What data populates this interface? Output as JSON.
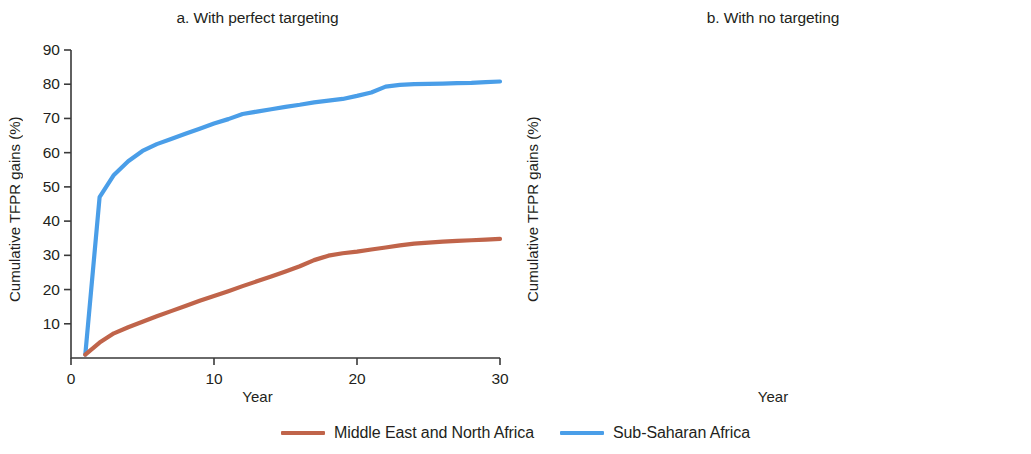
{
  "legend": {
    "items": [
      {
        "label": "Middle East and North Africa",
        "color": "#c0644a",
        "key": "mena"
      },
      {
        "label": "Sub-Saharan Africa",
        "color": "#4a9ee8",
        "key": "ssa"
      }
    ]
  },
  "panels": {
    "a": {
      "title": "a. With perfect targeting",
      "xlabel": "Year",
      "ylabel": "Cumulative TFPR gains (%)",
      "yticks": [
        "90",
        "80",
        "70",
        "60",
        "50",
        "40",
        "30",
        "20",
        "10"
      ],
      "xticks": [
        "0",
        "10",
        "20",
        "30"
      ]
    },
    "b": {
      "title": "b. With no targeting",
      "xlabel": "Year",
      "ylabel": "Cumulative TFPR gains (%)",
      "yticks": [
        "0",
        "-10",
        "-20",
        "-30",
        "-40",
        "-50",
        "-60"
      ],
      "xticks": [
        "0",
        "10",
        "20",
        "30"
      ]
    }
  },
  "chart_data": [
    {
      "id": "panel-a",
      "type": "line",
      "title": "a. With perfect targeting",
      "xlabel": "Year",
      "ylabel": "Cumulative TFPR gains (%)",
      "xlim": [
        0,
        30
      ],
      "ylim": [
        0,
        90
      ],
      "xticks": [
        0,
        10,
        20,
        30
      ],
      "yticks": [
        10,
        20,
        30,
        40,
        50,
        60,
        70,
        80,
        90
      ],
      "grid": false,
      "legend_position": "bottom-shared",
      "x": [
        1,
        2,
        3,
        4,
        5,
        6,
        7,
        8,
        9,
        10,
        11,
        12,
        13,
        14,
        15,
        16,
        17,
        18,
        19,
        20,
        21,
        22,
        23,
        24,
        25,
        26,
        27,
        28,
        29,
        30
      ],
      "series": [
        {
          "name": "Sub-Saharan Africa",
          "color": "#4a9ee8",
          "values": [
            1.0,
            47.0,
            53.5,
            57.5,
            60.5,
            62.5,
            64.0,
            65.5,
            67.0,
            68.5,
            69.8,
            71.3,
            72.0,
            72.7,
            73.4,
            74.0,
            74.7,
            75.2,
            75.7,
            76.6,
            77.6,
            79.3,
            79.8,
            80.0,
            80.1,
            80.2,
            80.3,
            80.4,
            80.6,
            80.8
          ]
        },
        {
          "name": "Middle East and North Africa",
          "color": "#c0644a",
          "values": [
            1.0,
            4.5,
            7.2,
            9.0,
            10.6,
            12.2,
            13.7,
            15.2,
            16.7,
            18.1,
            19.5,
            21.0,
            22.4,
            23.8,
            25.3,
            26.8,
            28.6,
            29.9,
            30.6,
            31.1,
            31.7,
            32.3,
            32.9,
            33.4,
            33.7,
            34.0,
            34.2,
            34.4,
            34.6,
            34.8
          ]
        }
      ]
    },
    {
      "id": "panel-b",
      "type": "line",
      "title": "b. With no targeting",
      "xlabel": "Year",
      "ylabel": "Cumulative TFPR gains (%)",
      "xlim": [
        0,
        30
      ],
      "ylim": [
        -60,
        0
      ],
      "xticks": [
        0,
        10,
        20,
        30
      ],
      "yticks": [
        -60,
        -50,
        -40,
        -30,
        -20,
        -10,
        0
      ],
      "grid": false,
      "reference_line": {
        "y": 0,
        "style": "dashed",
        "color": "#231f20"
      },
      "legend_position": "bottom-shared",
      "x": [
        0,
        1,
        2,
        3,
        4,
        5,
        6,
        7,
        8,
        9,
        10,
        11,
        12,
        13,
        14,
        15,
        16,
        17,
        18,
        19,
        20,
        21,
        22,
        23,
        24,
        25,
        26,
        27,
        28,
        29,
        30
      ],
      "series": [
        {
          "name": "Sub-Saharan Africa",
          "color": "#4a9ee8",
          "values": [
            -0.3,
            -9.2,
            -13.4,
            -12.6,
            -13.2,
            -13.8,
            -14.0,
            -13.8,
            -14.6,
            -14.9,
            -14.6,
            -13.9,
            -13.5,
            -13.2,
            -12.7,
            -12.8,
            -12.6,
            -12.2,
            -12.4,
            -13.0,
            -12.4,
            -11.4,
            -10.2,
            -9.5,
            -9.6,
            -10.0,
            -10.3,
            -10.4,
            -10.3,
            -10.2,
            -10.1
          ]
        },
        {
          "name": "Middle East and North Africa",
          "color": "#c0644a",
          "values": [
            -0.3,
            -4.5,
            -8.0,
            -9.6,
            -13.0,
            -17.5,
            -21.5,
            -25.0,
            -28.2,
            -28.4,
            -28.0,
            -31.5,
            -31.0,
            -34.0,
            -37.5,
            -40.3,
            -40.8,
            -43.4,
            -45.5,
            -46.1,
            -48.0,
            -48.8,
            -48.5,
            -48.0,
            -47.6,
            -47.4,
            -47.2,
            -46.4,
            -47.4,
            -47.2,
            -47.0,
            -46.9,
            -46.8
          ]
        }
      ]
    }
  ]
}
